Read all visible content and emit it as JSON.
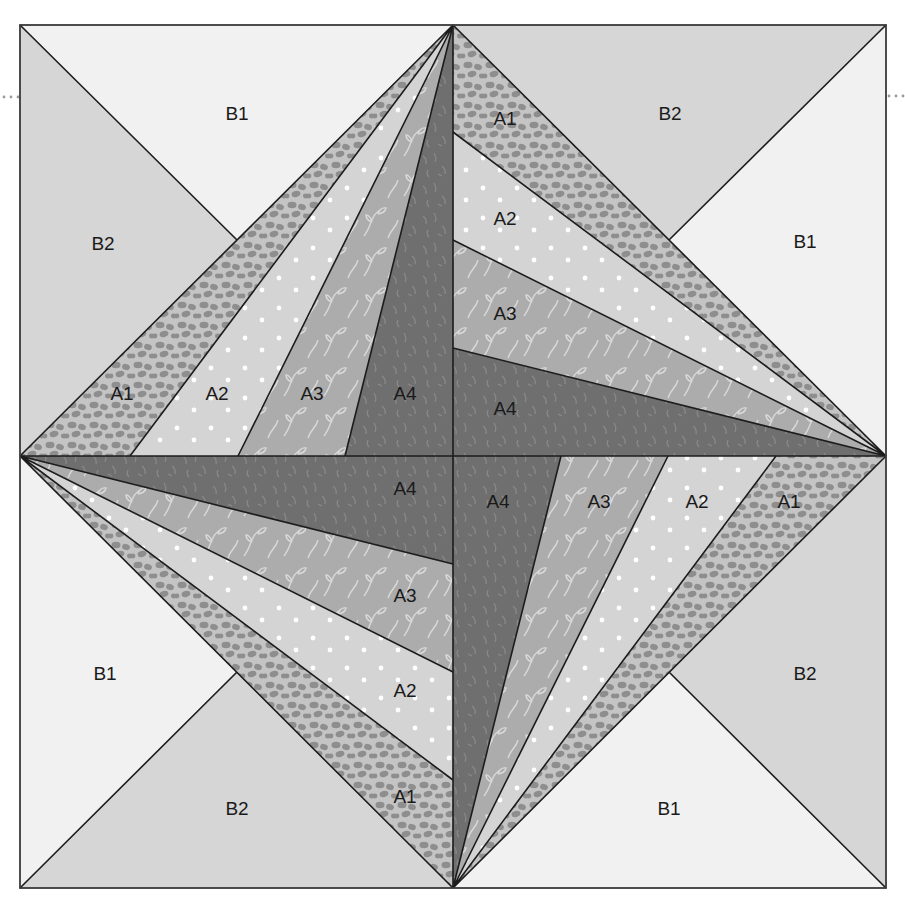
{
  "diagram": {
    "colors": {
      "B1": "#f1f1f1",
      "B2": "#d6d6d6",
      "A1": "#c4c4c4",
      "A1_pattern": "#8e8e8e",
      "A2": "#d4d4d4",
      "A2_dot": "#ffffff",
      "A3": "#acacac",
      "A3_vine": "#d9d9d9",
      "A4": "#6f6f6f",
      "A4_texture": "#8a8a8a",
      "line": "#1c1c1c"
    },
    "quadrants": {
      "top_left": {
        "labels": [
          {
            "text": "B1",
            "x": 237,
            "y": 115
          },
          {
            "text": "B2",
            "x": 103,
            "y": 245
          },
          {
            "text": "A1",
            "x": 122,
            "y": 395
          },
          {
            "text": "A2",
            "x": 217,
            "y": 395
          },
          {
            "text": "A3",
            "x": 312,
            "y": 395
          },
          {
            "text": "A4",
            "x": 405,
            "y": 395
          }
        ]
      },
      "top_right": {
        "labels": [
          {
            "text": "A1",
            "x": 505,
            "y": 120
          },
          {
            "text": "B2",
            "x": 670,
            "y": 115
          },
          {
            "text": "A2",
            "x": 505,
            "y": 220
          },
          {
            "text": "B1",
            "x": 805,
            "y": 243
          },
          {
            "text": "A3",
            "x": 505,
            "y": 315
          },
          {
            "text": "A4",
            "x": 505,
            "y": 410
          }
        ]
      },
      "bottom_left": {
        "labels": [
          {
            "text": "A4",
            "x": 405,
            "y": 490
          },
          {
            "text": "A3",
            "x": 405,
            "y": 597
          },
          {
            "text": "A2",
            "x": 405,
            "y": 692
          },
          {
            "text": "B1",
            "x": 105,
            "y": 675
          },
          {
            "text": "B2",
            "x": 237,
            "y": 810
          },
          {
            "text": "A1",
            "x": 405,
            "y": 798
          }
        ]
      },
      "bottom_right": {
        "labels": [
          {
            "text": "A4",
            "x": 498,
            "y": 503
          },
          {
            "text": "A3",
            "x": 599,
            "y": 503
          },
          {
            "text": "A2",
            "x": 697,
            "y": 503
          },
          {
            "text": "A1",
            "x": 789,
            "y": 503
          },
          {
            "text": "B2",
            "x": 805,
            "y": 675
          },
          {
            "text": "B1",
            "x": 669,
            "y": 810
          }
        ]
      }
    }
  }
}
